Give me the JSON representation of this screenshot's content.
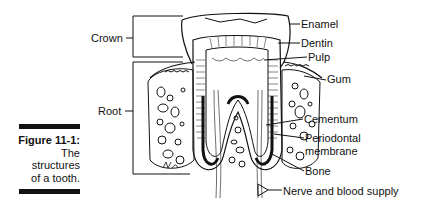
{
  "caption": {
    "figure_number": "Figure 11-1:",
    "lines": [
      "The",
      "structures",
      "of a tooth."
    ]
  },
  "labels": {
    "crown": "Crown",
    "root": "Root",
    "enamel": "Enamel",
    "dentin": "Dentin",
    "pulp": "Pulp",
    "gum": "Gum",
    "cementum": "Cementum",
    "periodontal_line1": "Periodontal",
    "periodontal_line2": "membrane",
    "bone": "Bone",
    "nerve": "Nerve and blood supply"
  },
  "colors": {
    "ink": "#111111",
    "background": "#ffffff"
  }
}
